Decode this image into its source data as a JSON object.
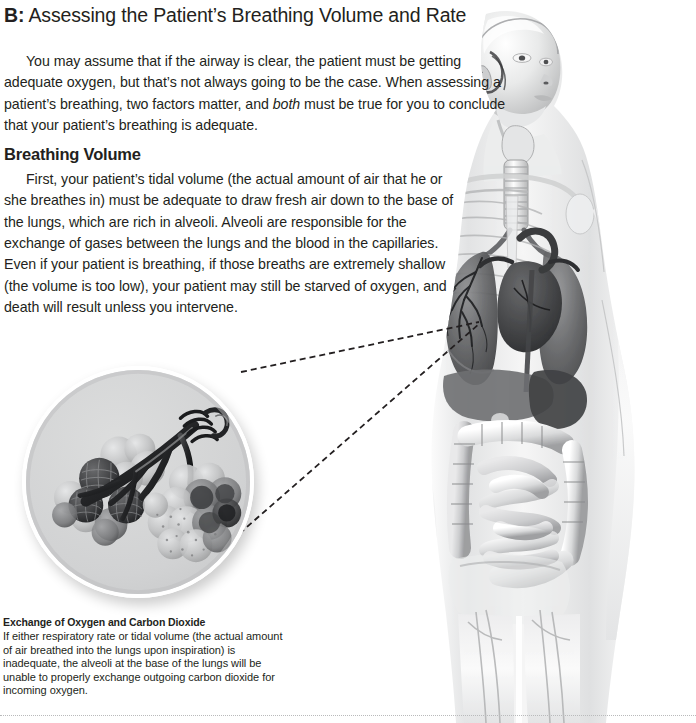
{
  "page": {
    "background_color": "#ffffff",
    "text_color": "#231f20",
    "width": 696,
    "height": 723
  },
  "header": {
    "label": "B:",
    "title": "Assessing the Patient’s Breathing Volume and Rate",
    "full_title": "B: Assessing the Patient’s Breathing Volume and Rate"
  },
  "body": {
    "intro_paragraph": "You may assume that if the airway is clear, the patient must be getting adequate oxygen, but that’s not always going to be the case. When assessing a patient’s breathing, two factors matter, and both must be true for you to conclude that your patient’s breathing is adequate.",
    "intro_segments": {
      "before_emphasis": "You may assume that if the airway is clear, the patient must be getting adequate oxygen, but that’s not always going to be the case. When assessing a patient’s breathing, two factors matter, and ",
      "emphasis": "both",
      "after_emphasis": " must be true for you to conclude that your patient’s breathing is adequate."
    },
    "section_heading": "Breathing Volume",
    "section_paragraph": "First, your patient’s tidal volume (the actual amount of air that he or she breathes in) must be adequate to draw fresh air down to the base of the lungs, which are rich in alveoli. Alveoli are responsible for the exchange of gases between the lungs and the blood in the capillaries. Even if your patient is breathing, if those breaths are extremely shallow (the volume is too low), your patient may still be starved of oxygen, and death will result unless you intervene."
  },
  "figure": {
    "name": "anatomical-body-illustration",
    "tones": {
      "skin_light": "#f2f2f2",
      "skin_mid": "#d8d9da",
      "organ_dark": "#4a4b4d",
      "organ_mid": "#8d8e90",
      "outline": "#bcbdbe"
    }
  },
  "inset": {
    "name": "alveoli-closeup",
    "description": "Circular magnified inset showing clusters of alveoli at the ends of bronchioles",
    "background_color": "#d2d3d4",
    "ring_color": "#ffffff",
    "leader_line_color": "#231f20",
    "leader_line_style": "dashed"
  },
  "caption": {
    "title": "Exchange of Oxygen and Carbon Dioxide",
    "text": "If either respiratory rate or tidal volume (the actual amount of air breathed into the lungs upon inspiration) is inadequate, the alveoli at the base of the lungs will be unable to properly exchange outgoing carbon dioxide for incoming oxygen."
  },
  "footer": {
    "rule_style": "dotted",
    "rule_color": "#b9babb"
  }
}
